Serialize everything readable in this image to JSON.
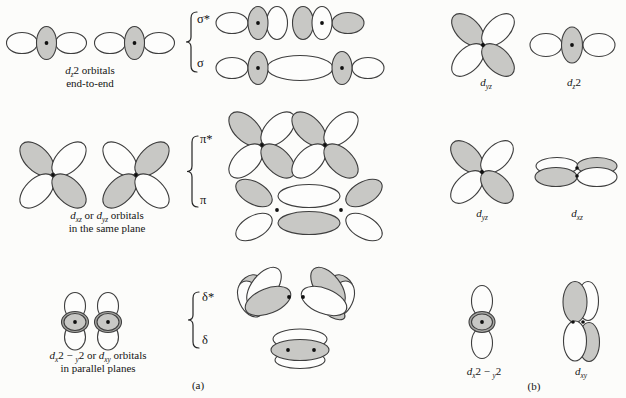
{
  "figure": {
    "panel_a_label": "(a)",
    "panel_b_label": "(b)",
    "mo_labels": {
      "sigma_star": "σ*",
      "sigma": "σ",
      "pi_star": "π*",
      "pi": "π",
      "delta_star": "δ*",
      "delta": "δ"
    },
    "captions": {
      "sigma": {
        "line1": [
          {
            "t": "d",
            "s": "i"
          },
          {
            "t": "z",
            "s": "sub"
          },
          {
            "t": "2",
            "s": "n"
          },
          {
            "t": " orbitals",
            "s": "n"
          }
        ],
        "line2": [
          {
            "t": "end-to-end",
            "s": "n"
          }
        ]
      },
      "pi": {
        "line1": [
          {
            "t": "d",
            "s": "i"
          },
          {
            "t": "xz",
            "s": "sub"
          },
          {
            "t": " or ",
            "s": "n"
          },
          {
            "t": "d",
            "s": "i"
          },
          {
            "t": "yz",
            "s": "sub"
          },
          {
            "t": " orbitals",
            "s": "n"
          }
        ],
        "line2": [
          {
            "t": "in the same plane",
            "s": "n"
          }
        ]
      },
      "delta": {
        "line1": [
          {
            "t": "d",
            "s": "i"
          },
          {
            "t": "x",
            "s": "sub"
          },
          {
            "t": "2",
            "s": "n"
          },
          {
            "t": " − ",
            "s": "n"
          },
          {
            "t": "y",
            "s": "sub"
          },
          {
            "t": "2",
            "s": "n"
          },
          {
            "t": " or ",
            "s": "n"
          },
          {
            "t": "d",
            "s": "i"
          },
          {
            "t": "xy",
            "s": "sub"
          },
          {
            "t": " orbitals",
            "s": "n"
          }
        ],
        "line2": [
          {
            "t": "in parallel planes",
            "s": "n"
          }
        ]
      }
    },
    "b_labels": {
      "row1_left": [
        {
          "t": "d",
          "s": "i"
        },
        {
          "t": "yz",
          "s": "sub"
        }
      ],
      "row1_right": [
        {
          "t": "d",
          "s": "i"
        },
        {
          "t": "z",
          "s": "sub"
        },
        {
          "t": "2",
          "s": "n"
        }
      ],
      "row2_left": [
        {
          "t": "d",
          "s": "i"
        },
        {
          "t": "yz",
          "s": "sub"
        }
      ],
      "row2_right": [
        {
          "t": "d",
          "s": "i"
        },
        {
          "t": "xz",
          "s": "sub"
        }
      ],
      "row3_left": [
        {
          "t": "d",
          "s": "i"
        },
        {
          "t": "x",
          "s": "sub"
        },
        {
          "t": "2",
          "s": "n"
        },
        {
          "t": " − ",
          "s": "n"
        },
        {
          "t": "y",
          "s": "sub"
        },
        {
          "t": "2",
          "s": "n"
        }
      ],
      "row3_right": [
        {
          "t": "d",
          "s": "i"
        },
        {
          "t": "xy",
          "s": "sub"
        }
      ]
    },
    "colors": {
      "shaded_lobe": "#c8c8c5",
      "shaded_dark": "#a6a6a3",
      "outline": "#3e3e3e",
      "background": "#fcfcfa",
      "text": "#141414"
    }
  }
}
